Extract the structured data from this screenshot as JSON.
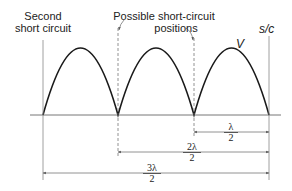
{
  "labels": {
    "second_short_circuit_line1": "Second",
    "second_short_circuit_line2": "short circuit",
    "possible_positions_line1": "Possible short-circuit",
    "possible_positions_line2": "positions",
    "voltage": "V",
    "short_circuit": "s/c"
  },
  "dimensions": [
    {
      "numerator": "λ",
      "denominator": "2"
    },
    {
      "numerator": "2λ",
      "denominator": "2"
    },
    {
      "numerator": "3λ",
      "denominator": "2"
    }
  ],
  "colors": {
    "curve": "#1a1a1a",
    "lines": "#777777",
    "text": "#222222"
  }
}
